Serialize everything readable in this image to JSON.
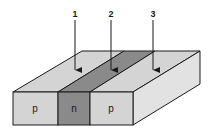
{
  "diagram": {
    "arrows": [
      {
        "label": "1"
      },
      {
        "label": "2"
      },
      {
        "label": "3"
      }
    ],
    "regions": [
      {
        "label": "p",
        "color": "#d4d4d4"
      },
      {
        "label": "n",
        "color": "#8a8a8a"
      },
      {
        "label": "p",
        "color": "#d4d4d4"
      }
    ],
    "colors": {
      "light": "#d4d4d4",
      "dark": "#8a8a8a",
      "side": "#e2e2e2",
      "stroke": "#1a1a1a"
    }
  }
}
